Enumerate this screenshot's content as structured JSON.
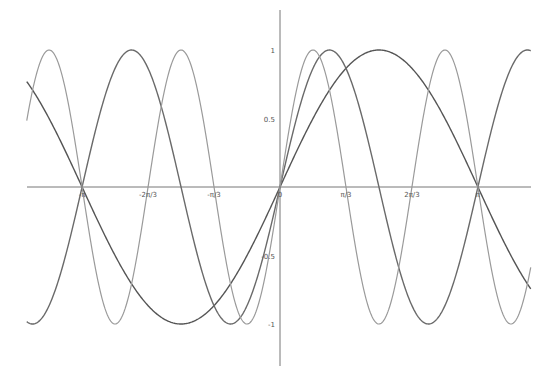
{
  "chart_data": {
    "type": "line",
    "title": "",
    "xlabel": "",
    "ylabel": "",
    "xlim": [
      -4.02,
      3.98
    ],
    "ylim": [
      -1.3,
      1.3
    ],
    "grid": false,
    "legend": null,
    "x_ticks": [
      {
        "value": -3.14159,
        "label": "-π"
      },
      {
        "value": -2.0944,
        "label": "-2π/3"
      },
      {
        "value": -1.0472,
        "label": "-π/3"
      },
      {
        "value": 0,
        "label": "0"
      },
      {
        "value": 1.0472,
        "label": "π/3"
      },
      {
        "value": 2.0944,
        "label": "2π/3"
      },
      {
        "value": 3.14159,
        "label": "π"
      }
    ],
    "y_ticks": [
      {
        "value": 1,
        "label": "1"
      },
      {
        "value": 0.5,
        "label": "0.5"
      },
      {
        "value": -0.5,
        "label": "-0.5"
      },
      {
        "value": -1,
        "label": "-1"
      }
    ],
    "series": [
      {
        "name": "sin(x)",
        "frequency": 1,
        "color": "#555555",
        "width": 1.4
      },
      {
        "name": "sin(2x)",
        "frequency": 2,
        "color": "#6a6a6a",
        "width": 1.4
      },
      {
        "name": "sin(3x)",
        "frequency": 3,
        "color": "#9a9a9a",
        "width": 1.2
      }
    ]
  },
  "layout": {
    "origin_px": [
      280,
      187
    ],
    "x_px_per_unit": 63.0,
    "y_px_per_unit": 137,
    "x_axis_px": [
      27,
      531
    ],
    "y_axis_px": [
      10,
      366
    ],
    "axis_color": "#777777"
  }
}
